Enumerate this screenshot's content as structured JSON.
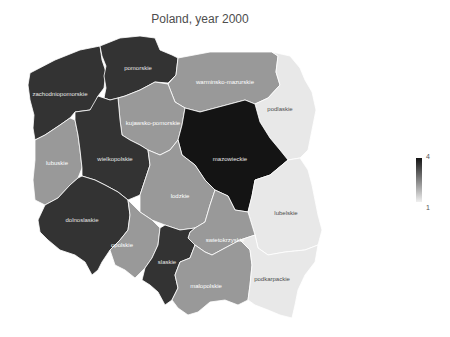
{
  "title": "Poland, year 2000",
  "legend": {
    "max_label": "4",
    "min_label": "1",
    "color_high": "#131313",
    "color_low": "#f0f0f0"
  },
  "regions": [
    {
      "name": "zachodniopomorskie",
      "value": 3,
      "fill": "#333333",
      "label_color": "#e6e6e6"
    },
    {
      "name": "pomorskie",
      "value": 3,
      "fill": "#333333",
      "label_color": "#e6e6e6"
    },
    {
      "name": "warminsko-mazurskie",
      "value": 2,
      "fill": "#999999",
      "label_color": "#ffffff"
    },
    {
      "name": "podlaskie",
      "value": 1,
      "fill": "#e8e8e8",
      "label_color": "#4d4d4d"
    },
    {
      "name": "kujawsko-pomorskie",
      "value": 2,
      "fill": "#999999",
      "label_color": "#ffffff"
    },
    {
      "name": "mazowieckie",
      "value": 4,
      "fill": "#141414",
      "label_color": "#e6e6e6"
    },
    {
      "name": "lubuskie",
      "value": 2,
      "fill": "#999999",
      "label_color": "#ffffff"
    },
    {
      "name": "wielkopolskie",
      "value": 3,
      "fill": "#333333",
      "label_color": "#e6e6e6"
    },
    {
      "name": "lodzkie",
      "value": 2,
      "fill": "#999999",
      "label_color": "#ffffff"
    },
    {
      "name": "lubelskie",
      "value": 1,
      "fill": "#e8e8e8",
      "label_color": "#4d4d4d"
    },
    {
      "name": "dolnoslaskie",
      "value": 3,
      "fill": "#333333",
      "label_color": "#e6e6e6"
    },
    {
      "name": "opolskie",
      "value": 2,
      "fill": "#999999",
      "label_color": "#ffffff"
    },
    {
      "name": "swietokrzyskie",
      "value": 2,
      "fill": "#999999",
      "label_color": "#ffffff"
    },
    {
      "name": "slaskie",
      "value": 3,
      "fill": "#333333",
      "label_color": "#e6e6e6"
    },
    {
      "name": "malopolskie",
      "value": 2,
      "fill": "#999999",
      "label_color": "#ffffff"
    },
    {
      "name": "podkarpackie",
      "value": 1,
      "fill": "#e8e8e8",
      "label_color": "#4d4d4d"
    }
  ]
}
